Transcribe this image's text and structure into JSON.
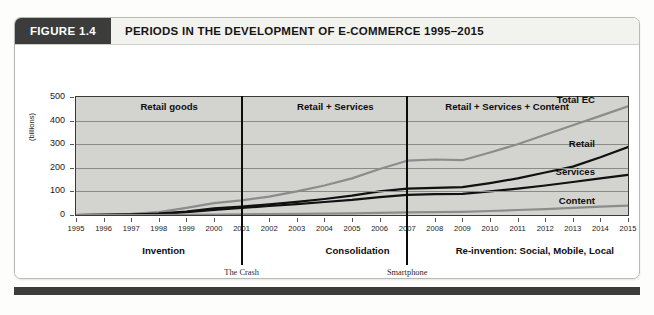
{
  "figure": {
    "tag": "FIGURE 1.4",
    "title": "PERIODS IN THE DEVELOPMENT OF E-COMMERCE 1995–2015"
  },
  "colors": {
    "header_tag_bg": "#3c3c3c",
    "plot_bg": "#d3d3d0",
    "total_ec_line": "#8c8c8c",
    "retail_line": "#111111",
    "services_line": "#111111",
    "content_line": "#8c8c8c",
    "divider": "#0c0c0c"
  },
  "eras": [
    {
      "label": "Retail goods",
      "x_pct": 17
    },
    {
      "label": "Retail + Services",
      "x_pct": 47
    },
    {
      "label": "Retail + Services + Content",
      "x_pct": 78
    }
  ],
  "phases": [
    {
      "label": "Invention",
      "x_pct": 16
    },
    {
      "label": "Consolidation",
      "x_pct": 51
    },
    {
      "label": "Re-invention: Social, Mobile, Local",
      "x_pct": 83
    }
  ],
  "events": [
    {
      "name": "The Crash",
      "year": "2000",
      "at_year": 2001
    },
    {
      "name": "Smartphone",
      "year": "2007",
      "at_year": 2007
    }
  ],
  "series_labels": [
    {
      "name": "Total EC"
    },
    {
      "name": "Retail"
    },
    {
      "name": "Services"
    },
    {
      "name": "Content"
    }
  ],
  "chart_data": {
    "type": "line",
    "title": "PERIODS IN THE DEVELOPMENT OF E-COMMERCE 1995–2015",
    "xlabel": "",
    "ylabel": "(billions)",
    "ylim": [
      0,
      500
    ],
    "yticks": [
      0,
      100,
      200,
      300,
      400,
      500
    ],
    "grid": true,
    "legend": "right-inline-labels",
    "x": [
      1995,
      1996,
      1997,
      1998,
      1999,
      2000,
      2001,
      2002,
      2003,
      2004,
      2005,
      2006,
      2007,
      2008,
      2009,
      2010,
      2011,
      2012,
      2013,
      2014,
      2015
    ],
    "series": [
      {
        "name": "Total EC",
        "color": "#8c8c8c",
        "values": [
          1,
          2,
          5,
          12,
          30,
          50,
          62,
          78,
          100,
          125,
          155,
          195,
          230,
          235,
          232,
          265,
          300,
          340,
          380,
          420,
          460
        ]
      },
      {
        "name": "Retail",
        "color": "#111111",
        "values": [
          0,
          1,
          2,
          6,
          15,
          28,
          36,
          45,
          56,
          68,
          82,
          100,
          112,
          115,
          118,
          135,
          155,
          180,
          205,
          245,
          288
        ]
      },
      {
        "name": "Services",
        "color": "#111111",
        "values": [
          0,
          1,
          2,
          5,
          12,
          22,
          30,
          38,
          46,
          55,
          64,
          76,
          85,
          88,
          90,
          100,
          112,
          125,
          140,
          155,
          170
        ]
      },
      {
        "name": "Content",
        "color": "#8c8c8c",
        "values": [
          0,
          0,
          0,
          0,
          1,
          2,
          3,
          4,
          5,
          6,
          7,
          9,
          11,
          12,
          13,
          17,
          21,
          25,
          30,
          35,
          40
        ]
      }
    ]
  }
}
